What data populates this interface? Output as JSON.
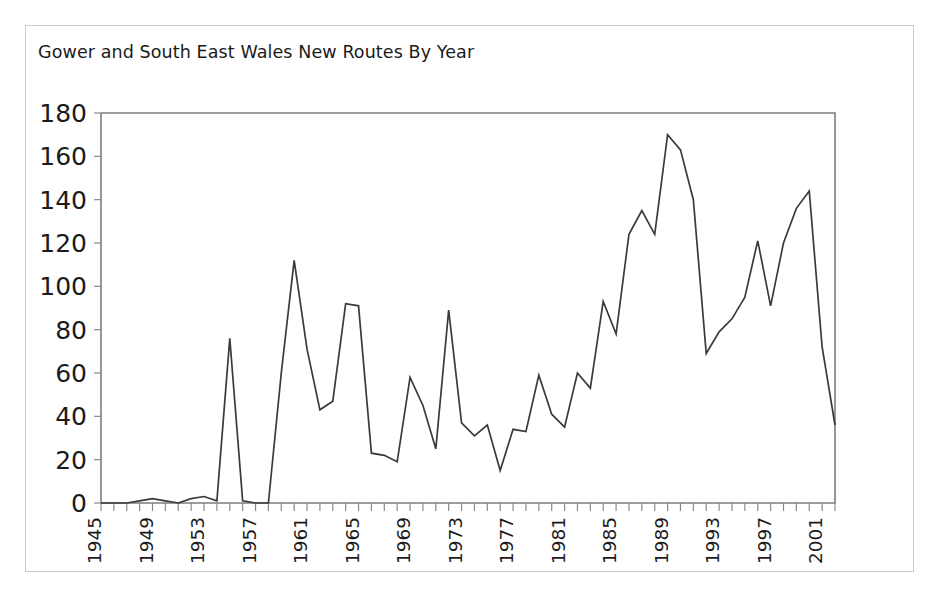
{
  "card": {
    "border_color": "#c9c9c9",
    "background": "#ffffff"
  },
  "chart_data": {
    "type": "line",
    "title": "Gower and South East Wales New Routes By Year",
    "xlabel": "",
    "ylabel": "",
    "ylim": [
      0,
      180
    ],
    "xlim": [
      1945,
      2002
    ],
    "grid": false,
    "legend": false,
    "line_color": "#3a3a3a",
    "axis_color": "#7d7d7d",
    "ytick_labels": [
      "0",
      "20",
      "40",
      "60",
      "80",
      "100",
      "120",
      "140",
      "160",
      "180"
    ],
    "ytick_values": [
      0,
      20,
      40,
      60,
      80,
      100,
      120,
      140,
      160,
      180
    ],
    "xtick_labels": [
      "1945",
      "1949",
      "1953",
      "1957",
      "1961",
      "1965",
      "1969",
      "1973",
      "1977",
      "1981",
      "1985",
      "1989",
      "1993",
      "1997",
      "2001"
    ],
    "xtick_values": [
      1945,
      1949,
      1953,
      1957,
      1961,
      1965,
      1969,
      1973,
      1977,
      1981,
      1985,
      1989,
      1993,
      1997,
      2001
    ],
    "x": [
      1945,
      1946,
      1947,
      1948,
      1949,
      1950,
      1951,
      1952,
      1953,
      1954,
      1955,
      1956,
      1957,
      1958,
      1959,
      1960,
      1961,
      1962,
      1963,
      1964,
      1965,
      1966,
      1967,
      1968,
      1969,
      1970,
      1971,
      1972,
      1973,
      1974,
      1975,
      1976,
      1977,
      1978,
      1979,
      1980,
      1981,
      1982,
      1983,
      1984,
      1985,
      1986,
      1987,
      1988,
      1989,
      1990,
      1991,
      1992,
      1993,
      1994,
      1995,
      1996,
      1997,
      1998,
      1999,
      2000,
      2001,
      2002
    ],
    "values": [
      0,
      0,
      0,
      1,
      2,
      1,
      0,
      2,
      3,
      1,
      76,
      1,
      0,
      0,
      60,
      112,
      71,
      43,
      47,
      92,
      91,
      23,
      22,
      19,
      58,
      45,
      25,
      89,
      37,
      31,
      36,
      15,
      34,
      33,
      59,
      41,
      35,
      60,
      53,
      93,
      78,
      124,
      135,
      124,
      170,
      163,
      140,
      69,
      79,
      85,
      95,
      121,
      91,
      120,
      136,
      144,
      72,
      36
    ],
    "series_name": "New Routes"
  }
}
